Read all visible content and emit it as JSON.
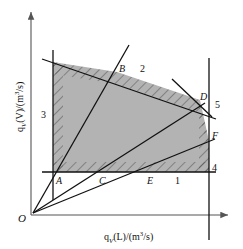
{
  "figure": {
    "axes": {
      "x_label_html": "q<sub>V</sub>(L)/(m<sup>3</sup>/s)",
      "y_label_html": "q<sub>V</sub>(V)/(m<sup>3</sup>/s)",
      "origin_label": "O"
    },
    "point_labels": [
      {
        "id": "A",
        "text": "A"
      },
      {
        "id": "B",
        "text": "B"
      },
      {
        "id": "C",
        "text": "C"
      },
      {
        "id": "D",
        "text": "D"
      },
      {
        "id": "E",
        "text": "E"
      },
      {
        "id": "F",
        "text": "F"
      }
    ],
    "line_labels": [
      {
        "id": "1",
        "text": "1"
      },
      {
        "id": "2",
        "text": "2"
      },
      {
        "id": "3",
        "text": "3"
      },
      {
        "id": "4",
        "text": "4"
      },
      {
        "id": "5",
        "text": "5"
      }
    ],
    "colors": {
      "fill": "#b3b3b3",
      "line": "#111111",
      "axis": "#555555",
      "hatch": "#4a4a4a"
    }
  },
  "chart_data": {
    "type": "line",
    "title": "",
    "xlabel": "qV(L)/(m^3/s)",
    "ylabel": "qV(V)/(m^3/s)",
    "xlim": [
      0,
      1
    ],
    "ylim": [
      0,
      1
    ],
    "grid": false,
    "legend": "none",
    "constraint_lines": [
      {
        "label": "1",
        "kind": "horizontal",
        "note": "lower horizontal boundary line",
        "y_px": 172
      },
      {
        "label": "2",
        "kind": "upper-boundary",
        "note": "upper sloping boundary from left to right, slightly descending"
      },
      {
        "label": "3",
        "kind": "vertical",
        "note": "left vertical boundary line",
        "x_px": 53
      },
      {
        "label": "4",
        "kind": "vertical",
        "note": "right vertical boundary line",
        "x_px": 209
      },
      {
        "label": "5",
        "kind": "steep-descending",
        "note": "short steep descending segment crossing near point D"
      }
    ],
    "rays_from_origin": [
      {
        "through": "A",
        "note": "steepest ray, meets line 3 at A and line 2 at B"
      },
      {
        "through": "C",
        "note": "middle ray, meets line 1 at C and line 5 near D"
      },
      {
        "through": "E",
        "note": "shallowest ray, meets line 1 at E and line 4 at F"
      }
    ],
    "region_vertices": [
      "A",
      "B",
      "D",
      "F",
      "E",
      "C"
    ],
    "points": [
      {
        "name": "A",
        "x_px": 58,
        "y_px": 180
      },
      {
        "name": "B",
        "x_px": 117,
        "y_px": 72
      },
      {
        "name": "C",
        "x_px": 101,
        "y_px": 181
      },
      {
        "name": "D",
        "x_px": 200,
        "y_px": 100
      },
      {
        "name": "E",
        "x_px": 150,
        "y_px": 181
      },
      {
        "name": "F",
        "x_px": 209,
        "y_px": 141
      }
    ]
  }
}
